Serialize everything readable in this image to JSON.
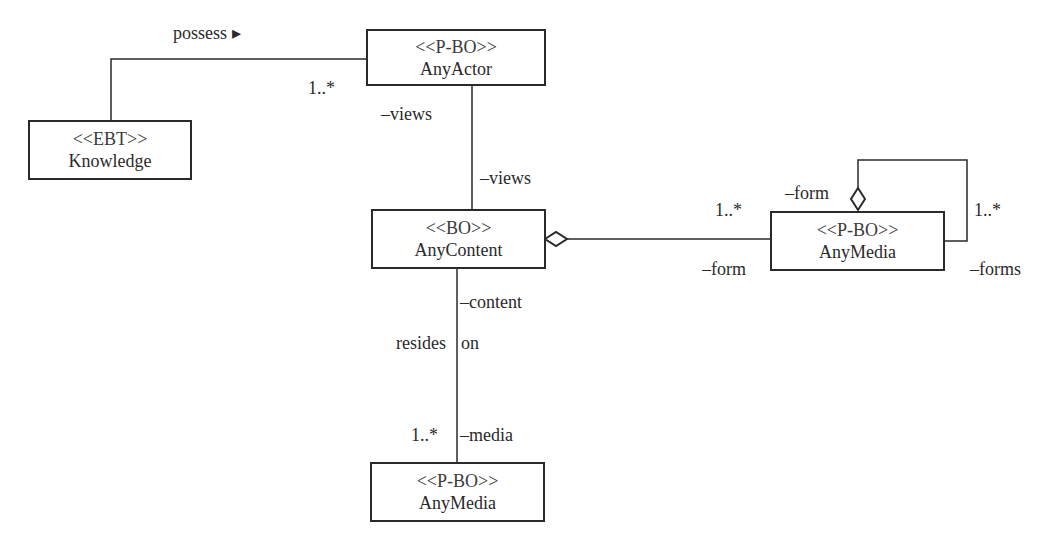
{
  "classes": {
    "any_actor": {
      "stereotype": "<<P-BO>>",
      "name": "AnyActor"
    },
    "knowledge": {
      "stereotype": "<<EBT>>",
      "name": "Knowledge"
    },
    "any_content": {
      "stereotype": "<<BO>>",
      "name": "AnyContent"
    },
    "any_media_right": {
      "stereotype": "<<P-BO>>",
      "name": "AnyMedia"
    },
    "any_media_bottom": {
      "stereotype": "<<P-BO>>",
      "name": "AnyMedia"
    }
  },
  "labels": {
    "possess": "possess ▸",
    "possess_mult": "1..*",
    "actor_views": "–views",
    "content_views": "–views",
    "agg_mult": "1..*",
    "agg_form": "–form",
    "self_form": "–form",
    "self_mult": "1..*",
    "self_forms": "–forms",
    "content_role": "–content",
    "resides": "resides",
    "on": "on",
    "media_mult": "1..*",
    "media_role": "–media"
  }
}
